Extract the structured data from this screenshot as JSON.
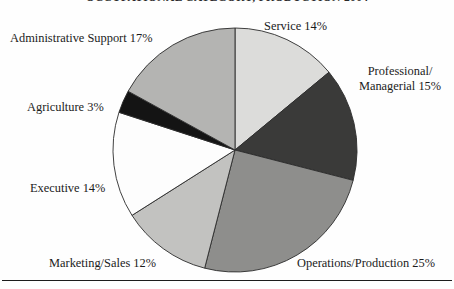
{
  "chart_data": {
    "type": "pie",
    "title": "OCCUPATIONAL CATEGORY, PRODUCTION 2004",
    "subtitle": "",
    "xlabel": "",
    "ylabel": "",
    "legend_position": "callout-labels",
    "grid": false,
    "value_suffix": "%",
    "total": 100,
    "start_angle_deg": 0,
    "direction": "clockwise",
    "categories": [
      "Service",
      "Professional/ Managerial",
      "Operations/Production",
      "Marketing/Sales",
      "Executive",
      "Agriculture",
      "Administrative Support"
    ],
    "values": [
      14,
      15,
      25,
      12,
      14,
      3,
      17
    ],
    "slices": [
      {
        "name": "Service",
        "label": "Service 14%",
        "value": 14,
        "color": "#dcdcda",
        "start_deg": 0,
        "end_deg": 50.4
      },
      {
        "name": "Professional/Managerial",
        "label_line1": "Professional/",
        "label_line2": "Managerial 15%",
        "label": "Professional/ Managerial 15%",
        "value": 15,
        "color": "#3a3a39",
        "start_deg": 50.4,
        "end_deg": 104.4
      },
      {
        "name": "Operations/Production",
        "label": "Operations/Production 25%",
        "value": 25,
        "color": "#8e8e8c",
        "start_deg": 104.4,
        "end_deg": 194.4
      },
      {
        "name": "Marketing/Sales",
        "label": "Marketing/Sales 12%",
        "value": 12,
        "color": "#c2c2c0",
        "start_deg": 194.4,
        "end_deg": 237.6
      },
      {
        "name": "Executive",
        "label": "Executive 14%",
        "value": 14,
        "color": "#fdfdfd",
        "start_deg": 237.6,
        "end_deg": 288.0
      },
      {
        "name": "Agriculture",
        "label": "Agriculture 3%",
        "value": 3,
        "color": "#141414",
        "start_deg": 288.0,
        "end_deg": 298.8
      },
      {
        "name": "Administrative Support",
        "label": "Administrative Support 17%",
        "value": 17,
        "color": "#b4b4b2",
        "start_deg": 298.8,
        "end_deg": 360.0
      }
    ],
    "geometry": {
      "center_x": 235,
      "center_y": 150,
      "radius": 122
    }
  },
  "labels": {
    "service": "Service 14%",
    "professional_line1": "Professional/",
    "professional_line2": "Managerial 15%",
    "operations": "Operations/Production 25%",
    "marketing": "Marketing/Sales 12%",
    "executive": "Executive 14%",
    "agriculture": "Agriculture 3%",
    "administrative": "Administrative Support 17%"
  }
}
